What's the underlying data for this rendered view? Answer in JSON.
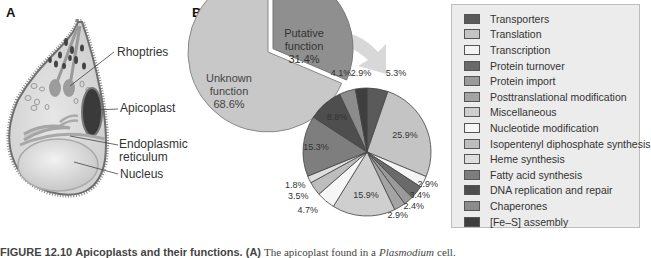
{
  "panelA": {
    "letter": "A",
    "labels": {
      "rhoptries": "Rhoptries",
      "apicoplast": "Apicoplast",
      "er_line1": "Endoplasmic",
      "er_line2": "reticulum",
      "nucleus": "Nucleus"
    }
  },
  "panelB": {
    "letter": "B"
  },
  "legend": {
    "items": [
      {
        "label": "Transporters",
        "color": "#5a5a5a"
      },
      {
        "label": "Translation",
        "color": "#c4c4c4"
      },
      {
        "label": "Transcription",
        "color": "#f4f4f4"
      },
      {
        "label": "Protein turnover",
        "color": "#6a6a6a"
      },
      {
        "label": "Protein import",
        "color": "#9a9a9a"
      },
      {
        "label": "Posttranslational modification",
        "color": "#a4a4a4"
      },
      {
        "label": "Miscellaneous",
        "color": "#cfcfcf"
      },
      {
        "label": "Nucleotide modification",
        "color": "#f6f6f6"
      },
      {
        "label": "Isopentenyl diphosphate synthesis",
        "color": "#bdbdbd"
      },
      {
        "label": "Heme synthesis",
        "color": "#dedede"
      },
      {
        "label": "Fatty acid synthesis",
        "color": "#7e7e7e"
      },
      {
        "label": "DNA replication and repair",
        "color": "#4e4e4e"
      },
      {
        "label": "Chaperones",
        "color": "#8c8c8c"
      },
      {
        "label": "[Fe–S] assembly",
        "color": "#3e3e3e"
      }
    ]
  },
  "caption": {
    "figure": "FIGURE 12.10",
    "title": "Apicoplasts and their functions.",
    "part": "(A)",
    "text": "The apicoplast found in a",
    "organism": "Plasmodium",
    "end": "cell."
  },
  "chart_data": [
    {
      "type": "pie",
      "title": "",
      "categories": [
        "Putative function",
        "Unknown function"
      ],
      "values": [
        31.4,
        68.6
      ],
      "labels": [
        "Putative function 31.4%",
        "Unknown function 68.6%"
      ],
      "exploded": "Putative function"
    },
    {
      "type": "pie",
      "title": "Breakdown of putative function",
      "categories": [
        "Transporters",
        "Translation",
        "Transcription",
        "Protein turnover",
        "Protein import",
        "Posttranslational modification",
        "Miscellaneous",
        "Nucleotide modification",
        "Isopentenyl diphosphate synthesis",
        "Heme synthesis",
        "Fatty acid synthesis",
        "DNA replication and repair",
        "Chaperones",
        "[Fe–S] assembly"
      ],
      "values": [
        5.3,
        25.9,
        2.9,
        3.4,
        2.4,
        2.9,
        15.9,
        4.7,
        3.5,
        1.8,
        15.3,
        8.8,
        4.1,
        2.9
      ],
      "labels": [
        "5.3%",
        "25.9%",
        "2.9%",
        "3.4%",
        "2.4%",
        "2.9%",
        "15.9%",
        "4.7%",
        "3.5%",
        "1.8%",
        "15.3%",
        "8.8%",
        "4.1%",
        "2.9%"
      ],
      "legend_position": "right"
    }
  ]
}
